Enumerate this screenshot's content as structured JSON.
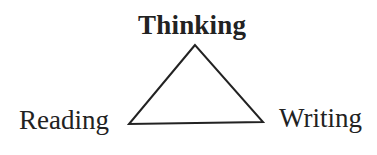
{
  "diagram": {
    "type": "triangle",
    "top_label": "Thinking",
    "left_label": "Reading",
    "right_label": "Writing",
    "line_color": "#222222"
  }
}
